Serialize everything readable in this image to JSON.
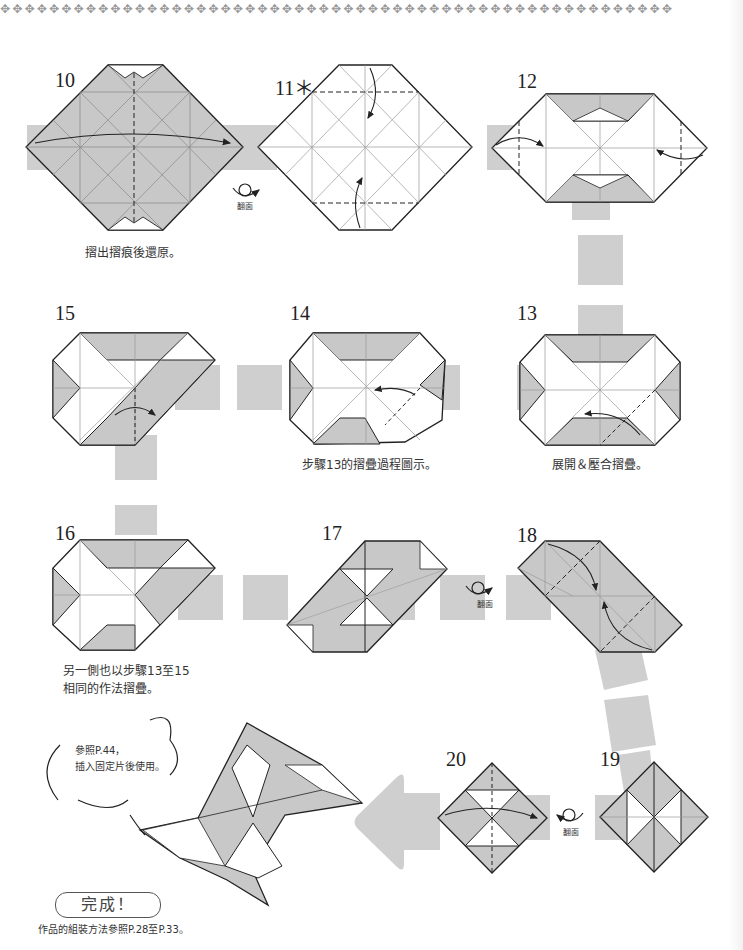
{
  "page": {
    "border_glyphs": "✥✥✥✥✥✥✥✥✥✥✥✥✥✥✥✥✥✥✥✥✥✥✥✥✥✥✥✥✥✥✥✥✥✥✥✥✥✥✥✥✥✥✥✥✥✥✥✥✥✥✥✥✥✥✥",
    "colors": {
      "paper_gray": "#c8c8c8",
      "line": "#222222",
      "connector": "#cfcfcf",
      "white": "#ffffff"
    }
  },
  "steps": [
    {
      "number": "10",
      "caption": "摺出摺痕後還原。"
    },
    {
      "number": "11＊",
      "caption": ""
    },
    {
      "number": "12",
      "caption": ""
    },
    {
      "number": "13",
      "caption": "展開＆壓合摺疊。"
    },
    {
      "number": "14",
      "caption": "步驟13的摺疊過程圖示。"
    },
    {
      "number": "15",
      "caption": ""
    },
    {
      "number": "16",
      "caption_line1": "另一側也以步驟13至15",
      "caption_line2": "相同的作法摺疊。"
    },
    {
      "number": "17",
      "caption": ""
    },
    {
      "number": "18",
      "caption": ""
    },
    {
      "number": "19",
      "caption": ""
    },
    {
      "number": "20",
      "caption": ""
    }
  ],
  "flip_labels": [
    "翻面",
    "翻面",
    "翻面"
  ],
  "bubble": {
    "line1": "參照P.44，",
    "line2": "插入固定片後使用。"
  },
  "finish": {
    "label": "完成！",
    "note": "作品的組裝方法參照P.28至P.33。"
  }
}
